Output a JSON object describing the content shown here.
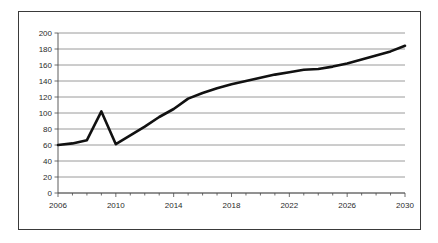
{
  "figure": {
    "background_color": "#ffffff",
    "border_color": "#3a3a3a",
    "plot_area": {
      "left": 58,
      "right": 405,
      "top": 33,
      "bottom": 193
    }
  },
  "chart_data": {
    "type": "line",
    "title": "",
    "subtitle": "",
    "xlabel": "",
    "ylabel": "",
    "xlim": [
      2006,
      2030
    ],
    "ylim": [
      0,
      200
    ],
    "grid": true,
    "grid_axis": "y",
    "legend": false,
    "legend_position": "none",
    "line_color": "#111111",
    "grid_color": "#808080",
    "y_ticks": [
      0,
      20,
      40,
      60,
      80,
      100,
      120,
      140,
      160,
      180,
      200
    ],
    "y_tick_labels": [
      "0",
      "20",
      "40",
      "60",
      "80",
      "100",
      "120",
      "140",
      "160",
      "180",
      "200"
    ],
    "x_ticks": [
      2006,
      2010,
      2014,
      2018,
      2022,
      2026,
      2030
    ],
    "x_tick_labels": [
      "2006",
      "2010",
      "2014",
      "2018",
      "2022",
      "2026",
      "2030"
    ],
    "x_minor_tick_interval": 1,
    "x": [
      2006,
      2007,
      2008,
      2009,
      2010,
      2011,
      2012,
      2013,
      2014,
      2015,
      2016,
      2017,
      2018,
      2019,
      2020,
      2021,
      2022,
      2023,
      2024,
      2025,
      2026,
      2027,
      2028,
      2029,
      2030
    ],
    "values": [
      60,
      62,
      66,
      102,
      61,
      72,
      83,
      95,
      105,
      118,
      125,
      131,
      136,
      140,
      144,
      148,
      151,
      154,
      155,
      158,
      162,
      167,
      172,
      177,
      184
    ],
    "series": [
      {
        "name": "series-1",
        "values": [
          60,
          62,
          66,
          102,
          61,
          72,
          83,
          95,
          105,
          118,
          125,
          131,
          136,
          140,
          144,
          148,
          151,
          154,
          155,
          158,
          162,
          167,
          172,
          177,
          184
        ]
      }
    ],
    "annotations": []
  }
}
